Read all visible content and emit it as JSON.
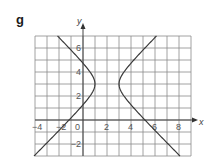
{
  "panel": {
    "label": "g"
  },
  "chart_data": {
    "type": "line",
    "title": "g",
    "xlabel": "x",
    "ylabel": "y",
    "xlim": [
      -4,
      9
    ],
    "ylim": [
      -3,
      7
    ],
    "grid": true,
    "grid_step": 1,
    "x_ticks": [
      -4,
      -2,
      0,
      2,
      4,
      6,
      8
    ],
    "x_tick_labels": [
      "-4",
      "-2",
      "0",
      "2",
      "4",
      "6",
      "8"
    ],
    "y_ticks": [
      -2,
      2,
      4,
      6
    ],
    "y_tick_labels": [
      "-2",
      "2",
      "4",
      "6"
    ],
    "equation": "(x-2)^2 - (y-3)^2 = 1",
    "center": [
      2,
      3
    ],
    "vertices": [
      [
        1,
        3
      ],
      [
        3,
        3
      ]
    ],
    "series": [
      {
        "name": "left branch",
        "points": [
          [
            -2.12,
            7
          ],
          [
            -1.16,
            6
          ],
          [
            -0.24,
            5
          ],
          [
            0.59,
            4
          ],
          [
            1,
            3
          ],
          [
            0.59,
            2
          ],
          [
            -0.24,
            1
          ],
          [
            -1.16,
            0
          ],
          [
            -2.12,
            -1
          ],
          [
            -3.1,
            -2
          ],
          [
            -4.08,
            -3
          ]
        ]
      },
      {
        "name": "right branch",
        "points": [
          [
            6.12,
            7
          ],
          [
            5.16,
            6
          ],
          [
            4.24,
            5
          ],
          [
            3.41,
            4
          ],
          [
            3,
            3
          ],
          [
            3.41,
            2
          ],
          [
            4.24,
            1
          ],
          [
            5.16,
            0
          ],
          [
            6.12,
            -1
          ],
          [
            7.1,
            -2
          ],
          [
            8.08,
            -3
          ]
        ]
      }
    ],
    "colors": {
      "curve": "#3a3a3a",
      "grid": "#8a8a8a",
      "axis": "#444444"
    }
  }
}
